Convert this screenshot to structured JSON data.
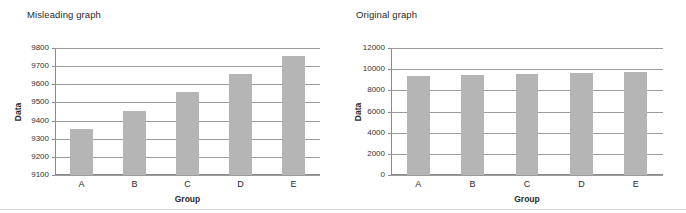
{
  "figure": {
    "panels": [
      {
        "title": "Misleading graph",
        "chart_data": {
          "type": "bar",
          "title": "Misleading graph",
          "categories": [
            "A",
            "B",
            "C",
            "D",
            "E"
          ],
          "values": [
            9355,
            9455,
            9555,
            9655,
            9755
          ],
          "xlabel": "Group",
          "ylabel": "Data",
          "ylim": [
            9100,
            9800
          ],
          "ytick_step": 100,
          "yticks": [
            9100,
            9200,
            9300,
            9400,
            9500,
            9600,
            9700,
            9800
          ],
          "ytick_labels": [
            "9100",
            "9200",
            "9300",
            "9400",
            "9500",
            "9600",
            "9700",
            "9800"
          ],
          "grid": true,
          "legend": null,
          "bar_color": "#b5b5b5"
        }
      },
      {
        "title": "Original graph",
        "chart_data": {
          "type": "bar",
          "title": "Original graph",
          "categories": [
            "A",
            "B",
            "C",
            "D",
            "E"
          ],
          "values": [
            9355,
            9455,
            9555,
            9655,
            9755
          ],
          "xlabel": "Group",
          "ylabel": "Data",
          "ylim": [
            0,
            12000
          ],
          "ytick_step": 2000,
          "yticks": [
            0,
            2000,
            4000,
            6000,
            8000,
            10000,
            12000
          ],
          "ytick_labels": [
            "0",
            "2000",
            "4000",
            "6000",
            "8000",
            "10000",
            "12000"
          ],
          "grid": true,
          "legend": null,
          "bar_color": "#b5b5b5"
        }
      }
    ]
  },
  "chart_data": [
    {
      "type": "bar",
      "title": "Misleading graph",
      "categories": [
        "A",
        "B",
        "C",
        "D",
        "E"
      ],
      "values": [
        9355,
        9455,
        9555,
        9655,
        9755
      ],
      "xlabel": "Group",
      "ylabel": "Data",
      "ylim": [
        9100,
        9800
      ],
      "yticks": [
        9100,
        9200,
        9300,
        9400,
        9500,
        9600,
        9700,
        9800
      ],
      "grid": true,
      "legend": null
    },
    {
      "type": "bar",
      "title": "Original graph",
      "categories": [
        "A",
        "B",
        "C",
        "D",
        "E"
      ],
      "values": [
        9355,
        9455,
        9555,
        9655,
        9755
      ],
      "xlabel": "Group",
      "ylabel": "Data",
      "ylim": [
        0,
        12000
      ],
      "yticks": [
        0,
        2000,
        4000,
        6000,
        8000,
        10000,
        12000
      ],
      "grid": true,
      "legend": null
    }
  ]
}
